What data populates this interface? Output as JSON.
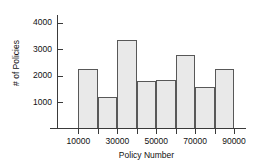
{
  "chart_data": {
    "type": "bar",
    "title": "",
    "subtitle": "",
    "xlabel": "Policy Number",
    "ylabel": "# of Policies",
    "grid": false,
    "legend": null,
    "legend_position": "none",
    "xlim": [
      0,
      90000
    ],
    "ylim": [
      0,
      4300
    ],
    "bin_width": 10000,
    "bin_edges": [
      10000,
      20000,
      30000,
      40000,
      50000,
      60000,
      70000,
      80000,
      90000
    ],
    "categories": [
      "10000-20000",
      "20000-30000",
      "30000-40000",
      "40000-50000",
      "50000-60000",
      "60000-70000",
      "70000-80000",
      "80000-90000"
    ],
    "values": [
      2250,
      1200,
      3350,
      1820,
      1850,
      2780,
      1580,
      2280
    ],
    "x_tick_labels": [
      "10000",
      "30000",
      "50000",
      "70000",
      "90000"
    ],
    "x_tick_values": [
      10000,
      30000,
      50000,
      70000,
      90000
    ],
    "y_tick_labels": [
      "1000",
      "2000",
      "3000",
      "4000"
    ],
    "y_tick_values": [
      1000,
      2000,
      3000,
      4000
    ],
    "annotations": [],
    "colors": {
      "bar_fill": "#e9e9e9",
      "bar_border": "#585858",
      "axis": "#3a3a3a",
      "text": "#111111",
      "background": "#ffffff"
    }
  }
}
